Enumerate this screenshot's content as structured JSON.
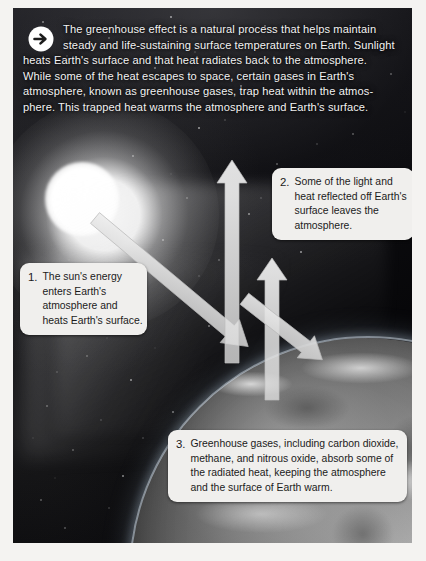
{
  "figure": {
    "title_icon": "arrow-right-circle-icon",
    "intro_lines": [
      "The greenhouse effect is a natural process that helps maintain",
      "steady and life-sustaining surface temperatures on Earth. Sunlight",
      "heats Earth's surface and that heat radiates back to the atmosphere.",
      "While some of the heat escapes to space, certain gases in Earth's",
      "atmosphere, known as greenhouse gases, trap heat within the atmos-",
      "phere. This  trapped heat warms the atmosphere and Earth's surface."
    ]
  },
  "callouts": [
    {
      "number": "1.",
      "lines": [
        "The sun's energy",
        "enters Earth's",
        "atmosphere and",
        "heats Earth's surface."
      ]
    },
    {
      "number": "2.",
      "lines": [
        "Some of the light and",
        "heat reflected off Earth's",
        "surface leaves the",
        "atmosphere."
      ]
    },
    {
      "number": "3.",
      "lines": [
        "Greenhouse gases, including carbon dioxide,",
        "methane, and nitrous oxide, absorb some of",
        "the radiated heat, keeping the atmosphere",
        "and the surface of Earth warm."
      ]
    }
  ],
  "scene": {
    "sun": "sun-icon",
    "earth": "earth-globe",
    "arrows": [
      {
        "name": "incoming-sunlight-arrow",
        "direction": "down-right"
      },
      {
        "name": "reflected-heat-arrow-up",
        "direction": "up"
      },
      {
        "name": "escaping-heat-arrow-up",
        "direction": "up"
      },
      {
        "name": "trapped-heat-arrow-down",
        "direction": "down-right"
      }
    ]
  },
  "colors": {
    "space": "#08080c",
    "callout_bg": "#f0efed",
    "text_light": "#f2f2f2",
    "text_dark": "#1b1b1b",
    "arrow_fill": "#d8d8d8",
    "page_bg": "#f4f3f1"
  }
}
